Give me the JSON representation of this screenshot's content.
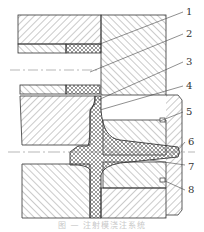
{
  "figure": {
    "type": "mold cross-section (injection gating system)",
    "callouts": [
      "1",
      "2",
      "3",
      "4",
      "5",
      "6",
      "7",
      "8"
    ],
    "caption": "图 — 注射模浇注系统"
  },
  "colors": {
    "line": "#333333",
    "hatch": "#666666",
    "background": "#ffffff",
    "caption": "#c8c8c8"
  }
}
